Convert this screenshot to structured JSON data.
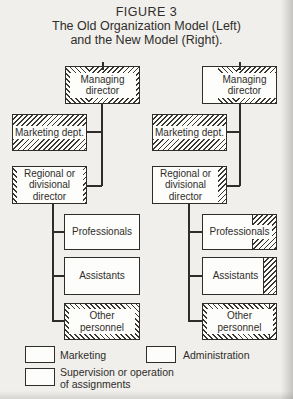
{
  "figure": {
    "title": "FIGURE 3",
    "subtitle1": "The Old Organization Model (Left)",
    "subtitle2": "and the New Model (Right)."
  },
  "old_model": {
    "managing_director": "Managing director",
    "marketing_dept": "Marketing dept.",
    "regional_director": "Regional or divisional director",
    "professionals": "Professionals",
    "assistants": "Assistants",
    "other_personnel": "Other personnel"
  },
  "new_model": {
    "managing_director": "Managing director",
    "marketing_dept": "Marketing dept.",
    "regional_director": "Regional or divisional director",
    "professionals": "Professionals",
    "assistants": "Assistants",
    "other_personnel": "Other personnel"
  },
  "legend": {
    "marketing": "Marketing",
    "administration": "Administration",
    "supervision_line1": "Supervision or operation",
    "supervision_line2": "of assignments"
  },
  "patterns": {
    "marketing": "forward-diagonal-hatch",
    "administration": "back-diagonal-hatch",
    "supervision": "white"
  },
  "colors": {
    "paper": "#f0efeb",
    "ink": "#2f2d2a",
    "box_fill": "#fdfdfb"
  }
}
